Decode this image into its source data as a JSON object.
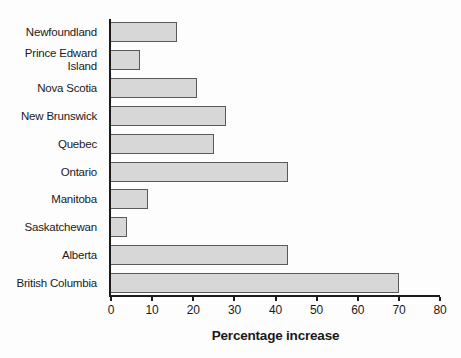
{
  "chart_data": {
    "type": "bar",
    "orientation": "horizontal",
    "categories": [
      "Newfoundland",
      "Prince Edward Island",
      "Nova Scotia",
      "New Brunswick",
      "Quebec",
      "Ontario",
      "Manitoba",
      "Saskatchewan",
      "Alberta",
      "British Columbia"
    ],
    "values": [
      16,
      7,
      21,
      28,
      25,
      43,
      9,
      4,
      43,
      70
    ],
    "xlabel": "Percentage increase",
    "xlim": [
      0,
      80
    ],
    "xticks": [
      0,
      10,
      20,
      30,
      40,
      50,
      60,
      70,
      80
    ],
    "grid": false,
    "legend": "none",
    "colors": {
      "bar_fill": "#d7d7d7",
      "bar_border": "#5a5a5a",
      "axis": "#1a1a1a",
      "text": "#1a1a1a"
    }
  }
}
